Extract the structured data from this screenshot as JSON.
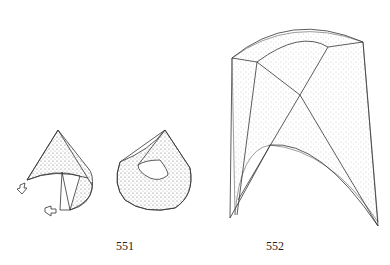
{
  "figures": [
    {
      "id": "fig-551",
      "label": "551",
      "description": "Two cone drawings showing a cone being rolled/folded, with arrows indicating the direction of folding"
    },
    {
      "id": "fig-552",
      "label": "552",
      "description": "Curved stippled surface shaped like an arch formed from folded cone-like pieces"
    }
  ],
  "colors": {
    "line": "#333333",
    "stipple": "#555555",
    "background": "#ffffff"
  }
}
